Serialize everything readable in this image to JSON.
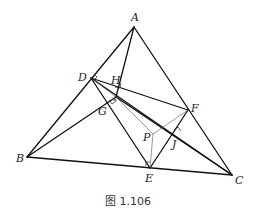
{
  "figure": {
    "caption": "图 1.106",
    "points": {
      "A": "A",
      "B": "B",
      "C": "C",
      "D": "D",
      "E": "E",
      "F": "F",
      "G": "G",
      "H": "H",
      "P": "P",
      "J": "J",
      "K": "K"
    },
    "thick_segments": [
      [
        "A",
        "B"
      ],
      [
        "A",
        "C"
      ],
      [
        "B",
        "C"
      ],
      [
        "D",
        "E"
      ],
      [
        "E",
        "F"
      ],
      [
        "F",
        "D"
      ],
      [
        "A",
        "K"
      ],
      [
        "B",
        "K"
      ],
      [
        "D",
        "C"
      ],
      [
        "K",
        "C"
      ]
    ],
    "thin_segments": [
      [
        "K",
        "P"
      ],
      [
        "P",
        "E"
      ],
      [
        "P",
        "F"
      ],
      [
        "D",
        "K"
      ]
    ],
    "right_angles": [
      "H",
      "G",
      "J",
      "E",
      "D"
    ]
  }
}
